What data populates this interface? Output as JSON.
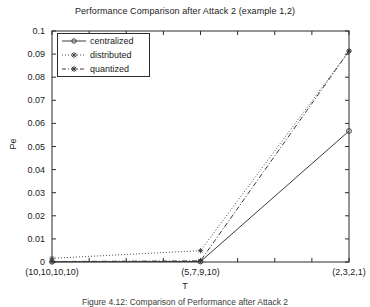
{
  "chart_data": {
    "type": "line",
    "title": "Performance Comparison after Attack 2 (example 1,2)",
    "xlabel": "T",
    "ylabel": "Pe",
    "categories": [
      "(10,10,10,10)",
      "(5,7,9,10)",
      "(2,3,2,1)"
    ],
    "x": [
      0,
      1,
      2
    ],
    "xlim": [
      0,
      2
    ],
    "ylim": [
      0,
      0.1
    ],
    "yticks": [
      "0",
      "0.01",
      "0.02",
      "0.03",
      "0.04",
      "0.05",
      "0.06",
      "0.07",
      "0.08",
      "0.09",
      "0.1"
    ],
    "ytick_values": [
      0,
      0.01,
      0.02,
      0.03,
      0.04,
      0.05,
      0.06,
      0.07,
      0.08,
      0.09,
      0.1
    ],
    "grid": false,
    "legend_position": "upper left",
    "series": [
      {
        "name": "centralized",
        "values": [
          0.0001,
          0.0002,
          0.0567
        ],
        "line_style": "solid",
        "marker": "circle",
        "color": "#3a3a3a"
      },
      {
        "name": "distributed",
        "values": [
          0.0016,
          0.0049,
          0.0913
        ],
        "line_style": "dotted",
        "marker": "asterisk",
        "color": "#4a4a4a"
      },
      {
        "name": "quantized",
        "values": [
          0.0002,
          0.0005,
          0.0913
        ],
        "line_style": "dashdot",
        "marker": "asterisk",
        "color": "#3a3a3a"
      }
    ]
  },
  "legend": {
    "items": [
      {
        "label": "centralized"
      },
      {
        "label": "distributed"
      },
      {
        "label": "quantized"
      }
    ]
  },
  "caption": {
    "text": "Figure 4.12:  Comparison of Performance after Attack 2"
  },
  "colors": {
    "axis": "#2b2b2b",
    "text": "#1a1a1a",
    "background": "#ffffff"
  }
}
